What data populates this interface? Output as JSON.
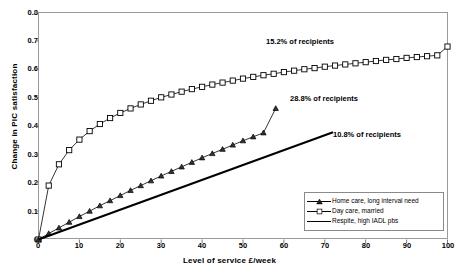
{
  "chart_data": {
    "type": "line",
    "title": "",
    "xlabel": "Level of service £/week",
    "ylabel": "Change in PIC satisfaction",
    "xlim": [
      0,
      100
    ],
    "ylim": [
      0,
      0.8
    ],
    "xticks": [
      0,
      10,
      20,
      30,
      40,
      50,
      60,
      70,
      80,
      90,
      100
    ],
    "yticks": [
      0,
      0.1,
      0.2,
      0.3,
      0.4,
      0.5,
      0.6,
      0.7,
      0.8
    ],
    "xtick_labels": [
      "0",
      "10",
      "20",
      "30",
      "40",
      "50",
      "60",
      "70",
      "80",
      "90",
      "100"
    ],
    "ytick_labels": [
      "0",
      "0.1",
      "0.2",
      "0.3",
      "0.4",
      "0.5",
      "0.6",
      "0.7",
      "0.8"
    ],
    "grid": false,
    "legend_position": "inside-bottom-right",
    "series": [
      {
        "name": "Day care, married",
        "marker": "square",
        "annotation": "15.2% of recipients",
        "x": [
          0,
          2.5,
          5,
          7.5,
          10,
          12.5,
          15,
          17.5,
          20,
          22.5,
          25,
          27.5,
          30,
          32.5,
          35,
          37.5,
          40,
          42.5,
          45,
          47.5,
          50,
          52.5,
          55,
          57.5,
          60,
          62.5,
          65,
          67.5,
          70,
          72.5,
          75,
          77.5,
          80,
          82.5,
          85,
          87.5,
          90,
          92.5,
          95,
          97.5,
          100
        ],
        "y": [
          0,
          0.19,
          0.265,
          0.315,
          0.352,
          0.382,
          0.407,
          0.428,
          0.446,
          0.462,
          0.476,
          0.489,
          0.501,
          0.511,
          0.521,
          0.53,
          0.538,
          0.546,
          0.553,
          0.56,
          0.567,
          0.573,
          0.579,
          0.584,
          0.59,
          0.595,
          0.6,
          0.604,
          0.609,
          0.613,
          0.617,
          0.621,
          0.625,
          0.629,
          0.633,
          0.636,
          0.64,
          0.643,
          0.646,
          0.649,
          0.68
        ]
      },
      {
        "name": "Home care, long interval need",
        "marker": "triangle",
        "annotation": "28.8% of recipients",
        "x": [
          0,
          2.5,
          5,
          7.5,
          10,
          12.5,
          15,
          17.5,
          20,
          22.5,
          25,
          27.5,
          30,
          32.5,
          35,
          37.5,
          40,
          42.5,
          45,
          47.5,
          50,
          52.5,
          55,
          58
        ],
        "y": [
          0,
          0.021,
          0.041,
          0.061,
          0.081,
          0.1,
          0.119,
          0.137,
          0.155,
          0.173,
          0.19,
          0.207,
          0.224,
          0.24,
          0.256,
          0.272,
          0.288,
          0.303,
          0.318,
          0.333,
          0.348,
          0.362,
          0.376,
          0.462
        ]
      },
      {
        "name": "Respite, high IADL pbs",
        "marker": "none",
        "annotation": "10.8% of recipients",
        "x": [
          0,
          72
        ],
        "y": [
          0,
          0.378
        ]
      }
    ]
  },
  "legend": {
    "items": [
      {
        "label": "Home care, long interval need"
      },
      {
        "label": "Day care, married"
      },
      {
        "label": "Respite, high IADL pbs"
      }
    ]
  },
  "annotations": [
    {
      "text": "15.2% of recipients"
    },
    {
      "text": "28.8% of recipients"
    },
    {
      "text": "10.8% of recipients"
    }
  ]
}
